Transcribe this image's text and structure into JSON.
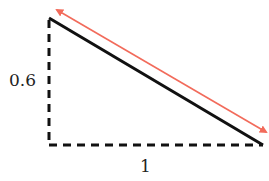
{
  "diagram": {
    "type": "right-triangle",
    "vertical_leg_label": "0.6",
    "horizontal_leg_label": "1",
    "hypotenuse": "solid black line",
    "arrow": "double-headed arrow parallel to hypotenuse",
    "colors": {
      "hypotenuse": "#111111",
      "legs": "#111111",
      "arrow": "#f26b5b"
    }
  }
}
